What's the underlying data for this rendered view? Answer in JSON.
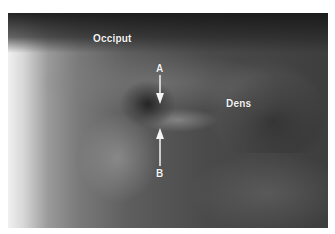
{
  "image": {
    "type": "radiograph",
    "description": "X-ray of craniocervical junction with annotated anatomical labels and arrows"
  },
  "labels": {
    "occiput": "Occiput",
    "dens": "Dens",
    "arrow_a": "A",
    "arrow_b": "B"
  },
  "colors": {
    "label_text": "#f4f4f4",
    "arrow": "#f4f4f4",
    "border": "#ffffff"
  }
}
